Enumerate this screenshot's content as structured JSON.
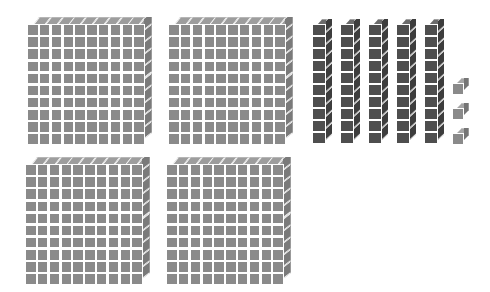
{
  "scene": {
    "title": "Base Ten Blocks Representation",
    "background_color": "#ffffff",
    "width": 490,
    "height": 292
  },
  "palette": {
    "flat_face": "#8a8a8a",
    "flat_top_facet": "#9d9d9d",
    "flat_right_facet": "#7a7a7a",
    "rod_face": "#4e4e4e",
    "rod_top_facet": "#6b6b6b",
    "rod_right_facet": "#3d3d3d",
    "unit_face": "#8a8a8a",
    "unit_top_facet": "#a5a5a5",
    "unit_right_facet": "#757575",
    "gap": "#ffffff"
  },
  "totals": {
    "hundreds_count": 4,
    "tens_count": 5,
    "ones_count": 3,
    "hundreds_value": 400,
    "tens_value": 50,
    "ones_value": 3,
    "total_value": 453
  },
  "groups": {
    "hundreds": {
      "label": "hundreds-flats",
      "unit_value": 100,
      "cells_per_block": 100,
      "rows": 10,
      "cols": 10,
      "blocks": [
        {
          "id": "flat-1",
          "x": 27,
          "y": 17
        },
        {
          "id": "flat-2",
          "x": 168,
          "y": 17
        },
        {
          "id": "flat-3",
          "x": 25,
          "y": 157
        },
        {
          "id": "flat-4",
          "x": 166,
          "y": 157
        }
      ]
    },
    "tens": {
      "label": "tens-rods",
      "unit_value": 10,
      "cells_per_block": 10,
      "rows": 10,
      "cols": 1,
      "blocks": [
        {
          "id": "rod-1",
          "x": 312,
          "y": 19
        },
        {
          "id": "rod-2",
          "x": 340,
          "y": 19
        },
        {
          "id": "rod-3",
          "x": 368,
          "y": 19
        },
        {
          "id": "rod-4",
          "x": 396,
          "y": 19
        },
        {
          "id": "rod-5",
          "x": 424,
          "y": 19
        }
      ]
    },
    "ones": {
      "label": "ones-units",
      "unit_value": 1,
      "cells_per_block": 1,
      "rows": 1,
      "cols": 1,
      "blocks": [
        {
          "id": "unit-1",
          "x": 452,
          "y": 78
        },
        {
          "id": "unit-2",
          "x": 452,
          "y": 103
        },
        {
          "id": "unit-3",
          "x": 452,
          "y": 128
        }
      ]
    }
  }
}
